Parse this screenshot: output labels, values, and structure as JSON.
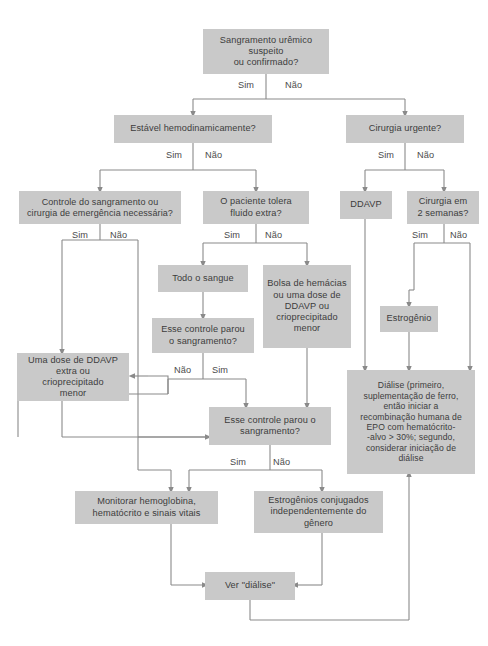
{
  "diagram": {
    "box_fill": "#c9c9c9",
    "text_color": "#3c3c3c",
    "line_color": "#7a7a7a",
    "background": "#ffffff"
  },
  "nodes": {
    "start": {
      "text": "Sangramento urêmico suspeito\nou confirmado?"
    },
    "estavel": {
      "text": "Estável hemodinamicamente?"
    },
    "cirurgia_urgente": {
      "text": "Cirurgia urgente?"
    },
    "controle_sangramento": {
      "text": "Controle do sangramento ou\ncirurgia de emergência necessária?"
    },
    "tolera_fluido": {
      "text": "O paciente tolera\nfluido extra?"
    },
    "ddavp": {
      "text": "DDAVP"
    },
    "cirurgia_2semanas": {
      "text": "Cirurgia em\n2 semanas?"
    },
    "todo_sangue": {
      "text": "Todo o sangue"
    },
    "bolsa_hemacias": {
      "text": "Bolsa de hemácias\nou uma dose de\nDDAVP ou\ncrioprecipitado\nmenor"
    },
    "estrogenio": {
      "text": "Estrogênio"
    },
    "esse_controle_1": {
      "text": "Esse controle parou\no sangramento?"
    },
    "uma_dose_ddavp": {
      "text": "Uma dose de DDAVP\nextra ou\ncrioprecipitado\nmenor"
    },
    "esse_controle_2": {
      "text": "Esse controle parou o\nsangramento?"
    },
    "dialise_grande": {
      "text": "Diálise (primeiro,\nsuplementação de ferro,\nentão iniciar a\nrecombinação humana de\nEPO com hematócrito-\n-alvo > 30%; segundo,\nconsiderar iniciação de\ndiálise"
    },
    "monitorar": {
      "text": "Monitorar hemoglobina,\nhematócrito e sinais vitais"
    },
    "estrogenios_conjugados": {
      "text": "Estrogênios conjugados\nindependentemente do\ngênero"
    },
    "ver_dialise": {
      "text": "Ver \"diálise\""
    }
  },
  "edge_labels": {
    "start_sim": "Sim",
    "start_nao": "Não",
    "estavel_sim": "Sim",
    "estavel_nao": "Não",
    "cirurgia_sim": "Sim",
    "cirurgia_nao": "Não",
    "controle_sim": "Sim",
    "controle_nao": "Não",
    "tolera_sim": "Sim",
    "tolera_nao": "Não",
    "semanas_sim": "Sim",
    "semanas_nao": "Não",
    "esse1_nao": "Não",
    "esse1_sim": "Sim",
    "esse2_sim": "Sim",
    "esse2_nao": "Não"
  }
}
